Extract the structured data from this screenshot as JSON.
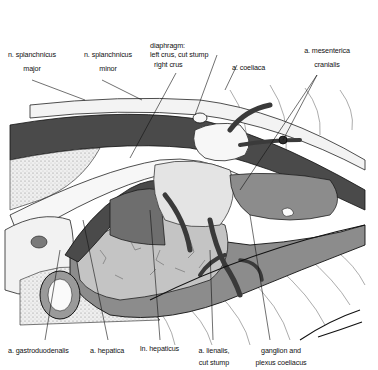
{
  "figure": {
    "colors": {
      "dark_vessel": "#4a4a4a",
      "mid_organ": "#8c8c8c",
      "light_organ": "#c4c4c4",
      "pale": "#e6e6e6",
      "line": "#111111",
      "background": "#ffffff"
    }
  },
  "labels": {
    "top": [
      {
        "id": "splanchnicus_major",
        "line1": "n. splanchnicus",
        "line2": "major"
      },
      {
        "id": "splanchnicus_minor",
        "line1": "n. splanchnicus",
        "line2": "minor"
      },
      {
        "id": "diaphragm",
        "line1": "diaphragm:",
        "line2": "left crus, cut stump",
        "line3": "right crus"
      },
      {
        "id": "coeliaca",
        "line1": "a. coeliaca"
      },
      {
        "id": "mesenterica",
        "line1": "a. mesenterica",
        "line2": "cranialis"
      }
    ],
    "bottom": [
      {
        "id": "gastroduodenalis",
        "line1": "a. gastroduodenalis"
      },
      {
        "id": "hepatica",
        "line1": "a. hepatica"
      },
      {
        "id": "ln_hepaticus",
        "line1": "ln. hepaticus"
      },
      {
        "id": "lienalis",
        "line1": "a. lienalis,",
        "line2": "cut stump"
      },
      {
        "id": "ganglion",
        "line1": "ganglion and",
        "line2": "plexus coeliacus"
      }
    ]
  }
}
